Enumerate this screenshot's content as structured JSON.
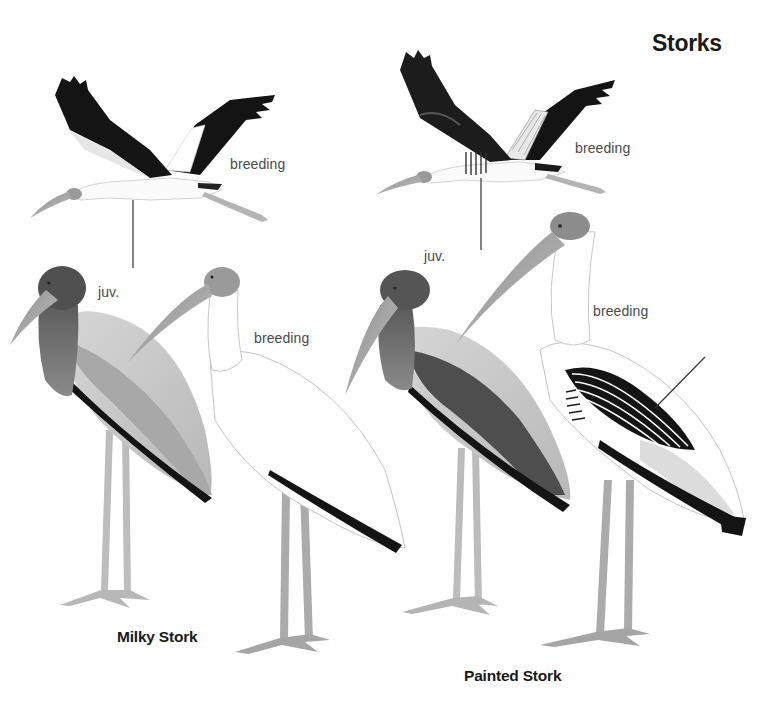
{
  "plate": {
    "title": "Storks",
    "species": [
      {
        "name": "Milky Stork",
        "figures": [
          {
            "pose": "flight",
            "label": "breeding"
          },
          {
            "pose": "standing",
            "label": "juv."
          },
          {
            "pose": "standing",
            "label": "breeding"
          }
        ]
      },
      {
        "name": "Painted Stork",
        "figures": [
          {
            "pose": "flight",
            "label": "breeding"
          },
          {
            "pose": "standing",
            "label": "juv."
          },
          {
            "pose": "standing",
            "label": "breeding"
          }
        ]
      }
    ]
  },
  "colors": {
    "background": "#ffffff",
    "flight_black": "#141414",
    "juvenile_grey": "#6e6e6e",
    "leg_grey": "#b4b4b4",
    "text": "#1a1a1a",
    "label_text": "#4a4a4a"
  }
}
